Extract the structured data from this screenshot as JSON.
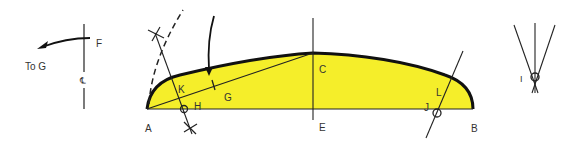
{
  "colors": {
    "fill": "#f5ee2a",
    "outline": "#111111",
    "line": "#222222",
    "label": "#333333",
    "background": "#ffffff"
  },
  "left_detail": {
    "point_label": "F",
    "centerline_symbol": "℄",
    "arrow_label": "To G"
  },
  "main_shape": {
    "points": {
      "A": "A",
      "B": "B",
      "C": "C",
      "E": "E",
      "G": "G",
      "H": "H",
      "J": "J",
      "K": "K",
      "L": "L"
    }
  },
  "right_detail": {
    "point_label": "I"
  }
}
